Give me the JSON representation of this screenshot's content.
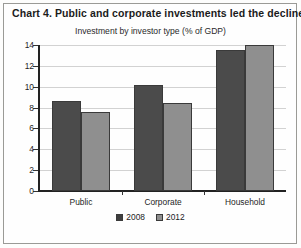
{
  "chart_data": {
    "type": "bar",
    "title": "Chart 4. Public and corporate investments led the decline",
    "subtitle": "Investment by investor type (% of GDP)",
    "categories": [
      "Public",
      "Corporate",
      "Household"
    ],
    "series": [
      {
        "name": "2008",
        "color": "#4b4b4b",
        "values": [
          8.6,
          10.2,
          13.5
        ]
      },
      {
        "name": "2012",
        "color": "#8f8f8f",
        "values": [
          7.6,
          8.4,
          14.0
        ]
      }
    ],
    "xlabel": "",
    "ylabel": "",
    "ylim": [
      0,
      14
    ],
    "ytick_step": 2,
    "yticks": [
      0,
      2,
      4,
      6,
      8,
      10,
      12,
      14
    ],
    "ytick_labels": [
      "0",
      "2",
      "4",
      "6",
      "8",
      "10",
      "12",
      "14"
    ],
    "grid": true,
    "legend_position": "bottom"
  }
}
